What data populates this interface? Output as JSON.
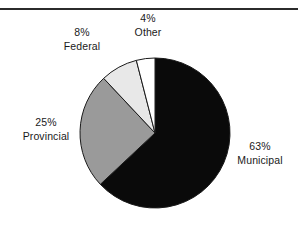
{
  "figure": {
    "rule_color": "#2b2b2b",
    "background": "#ffffff"
  },
  "chart_data": {
    "type": "pie",
    "title": "",
    "subtitle": "",
    "xlabel": "",
    "ylabel": "",
    "grid": false,
    "legend_position": "none",
    "labels_outside": true,
    "start_angle_deg": 0,
    "direction": "clockwise",
    "center_px": [
      155,
      133
    ],
    "radius_px": 75,
    "categories": [
      "Municipal",
      "Provincial",
      "Federal",
      "Other"
    ],
    "values": [
      63,
      25,
      8,
      4
    ],
    "units": "percent",
    "colors": [
      "#0a0a0a",
      "#9a9a9a",
      "#e8e8e8",
      "#ffffff"
    ],
    "edge_color": "#1a1a1a",
    "slices": [
      {
        "name": "Municipal",
        "percent_label": "63%",
        "value": 63,
        "color": "#0a0a0a",
        "start_deg": 0,
        "end_deg": 226.8
      },
      {
        "name": "Provincial",
        "percent_label": "25%",
        "value": 25,
        "color": "#9a9a9a",
        "start_deg": 226.8,
        "end_deg": 316.8
      },
      {
        "name": "Federal",
        "percent_label": "8%",
        "value": 8,
        "color": "#e8e8e8",
        "start_deg": 316.8,
        "end_deg": 345.6
      },
      {
        "name": "Other",
        "percent_label": "4%",
        "value": 4,
        "color": "#ffffff",
        "start_deg": 345.6,
        "end_deg": 360
      }
    ]
  },
  "labels": {
    "other": {
      "percent": "4%",
      "name": "Other"
    },
    "federal": {
      "percent": "8%",
      "name": "Federal"
    },
    "provincial": {
      "percent": "25%",
      "name": "Provincial"
    },
    "municipal": {
      "percent": "63%",
      "name": "Municipal"
    }
  }
}
